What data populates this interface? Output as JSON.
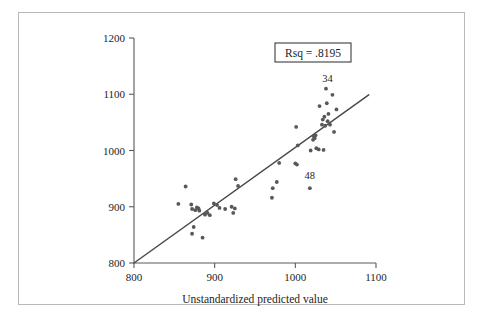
{
  "chart_data": {
    "type": "scatter",
    "title": "",
    "xlabel": "Unstandardized predicted value",
    "ylabel": "",
    "xlim": [
      800,
      1100
    ],
    "ylim": [
      800,
      1200
    ],
    "xticks": [
      800,
      900,
      1000,
      1100
    ],
    "yticks": [
      800,
      900,
      1000,
      1100,
      1200
    ],
    "grid": false,
    "legend": null,
    "annotations": {
      "rsq_label": "Rsq = .8195",
      "point_labels": [
        {
          "text": "34",
          "x": 1040,
          "y": 1122
        },
        {
          "text": "48",
          "x": 1018,
          "y": 949
        }
      ]
    },
    "fit_line": {
      "x": [
        800,
        1091
      ],
      "y": [
        800,
        1099
      ]
    },
    "points": [
      {
        "x": 855,
        "y": 905
      },
      {
        "x": 864,
        "y": 936
      },
      {
        "x": 871,
        "y": 904
      },
      {
        "x": 872,
        "y": 896
      },
      {
        "x": 876,
        "y": 894
      },
      {
        "x": 878,
        "y": 899
      },
      {
        "x": 880,
        "y": 897
      },
      {
        "x": 881,
        "y": 893
      },
      {
        "x": 874,
        "y": 864
      },
      {
        "x": 872,
        "y": 852
      },
      {
        "x": 885,
        "y": 845
      },
      {
        "x": 888,
        "y": 886
      },
      {
        "x": 891,
        "y": 889
      },
      {
        "x": 894,
        "y": 885
      },
      {
        "x": 899,
        "y": 906
      },
      {
        "x": 903,
        "y": 903
      },
      {
        "x": 906,
        "y": 898
      },
      {
        "x": 913,
        "y": 896
      },
      {
        "x": 921,
        "y": 900
      },
      {
        "x": 923,
        "y": 889
      },
      {
        "x": 925,
        "y": 897
      },
      {
        "x": 926,
        "y": 949
      },
      {
        "x": 929,
        "y": 937
      },
      {
        "x": 971,
        "y": 916
      },
      {
        "x": 972,
        "y": 933
      },
      {
        "x": 977,
        "y": 944
      },
      {
        "x": 980,
        "y": 978
      },
      {
        "x": 1000,
        "y": 977
      },
      {
        "x": 1002,
        "y": 975
      },
      {
        "x": 1003,
        "y": 1009
      },
      {
        "x": 1001,
        "y": 1042
      },
      {
        "x": 1018,
        "y": 933
      },
      {
        "x": 1019,
        "y": 1000
      },
      {
        "x": 1022,
        "y": 1019
      },
      {
        "x": 1023,
        "y": 1025
      },
      {
        "x": 1024,
        "y": 1022
      },
      {
        "x": 1025,
        "y": 1027
      },
      {
        "x": 1026,
        "y": 1004
      },
      {
        "x": 1029,
        "y": 1002
      },
      {
        "x": 1030,
        "y": 1079
      },
      {
        "x": 1033,
        "y": 1046
      },
      {
        "x": 1034,
        "y": 1055
      },
      {
        "x": 1035,
        "y": 1001
      },
      {
        "x": 1036,
        "y": 1060
      },
      {
        "x": 1037,
        "y": 1044
      },
      {
        "x": 1038,
        "y": 1110
      },
      {
        "x": 1039,
        "y": 1084
      },
      {
        "x": 1040,
        "y": 1052
      },
      {
        "x": 1041,
        "y": 1065
      },
      {
        "x": 1043,
        "y": 1046
      },
      {
        "x": 1046,
        "y": 1099
      },
      {
        "x": 1048,
        "y": 1033
      },
      {
        "x": 1051,
        "y": 1073
      }
    ]
  }
}
